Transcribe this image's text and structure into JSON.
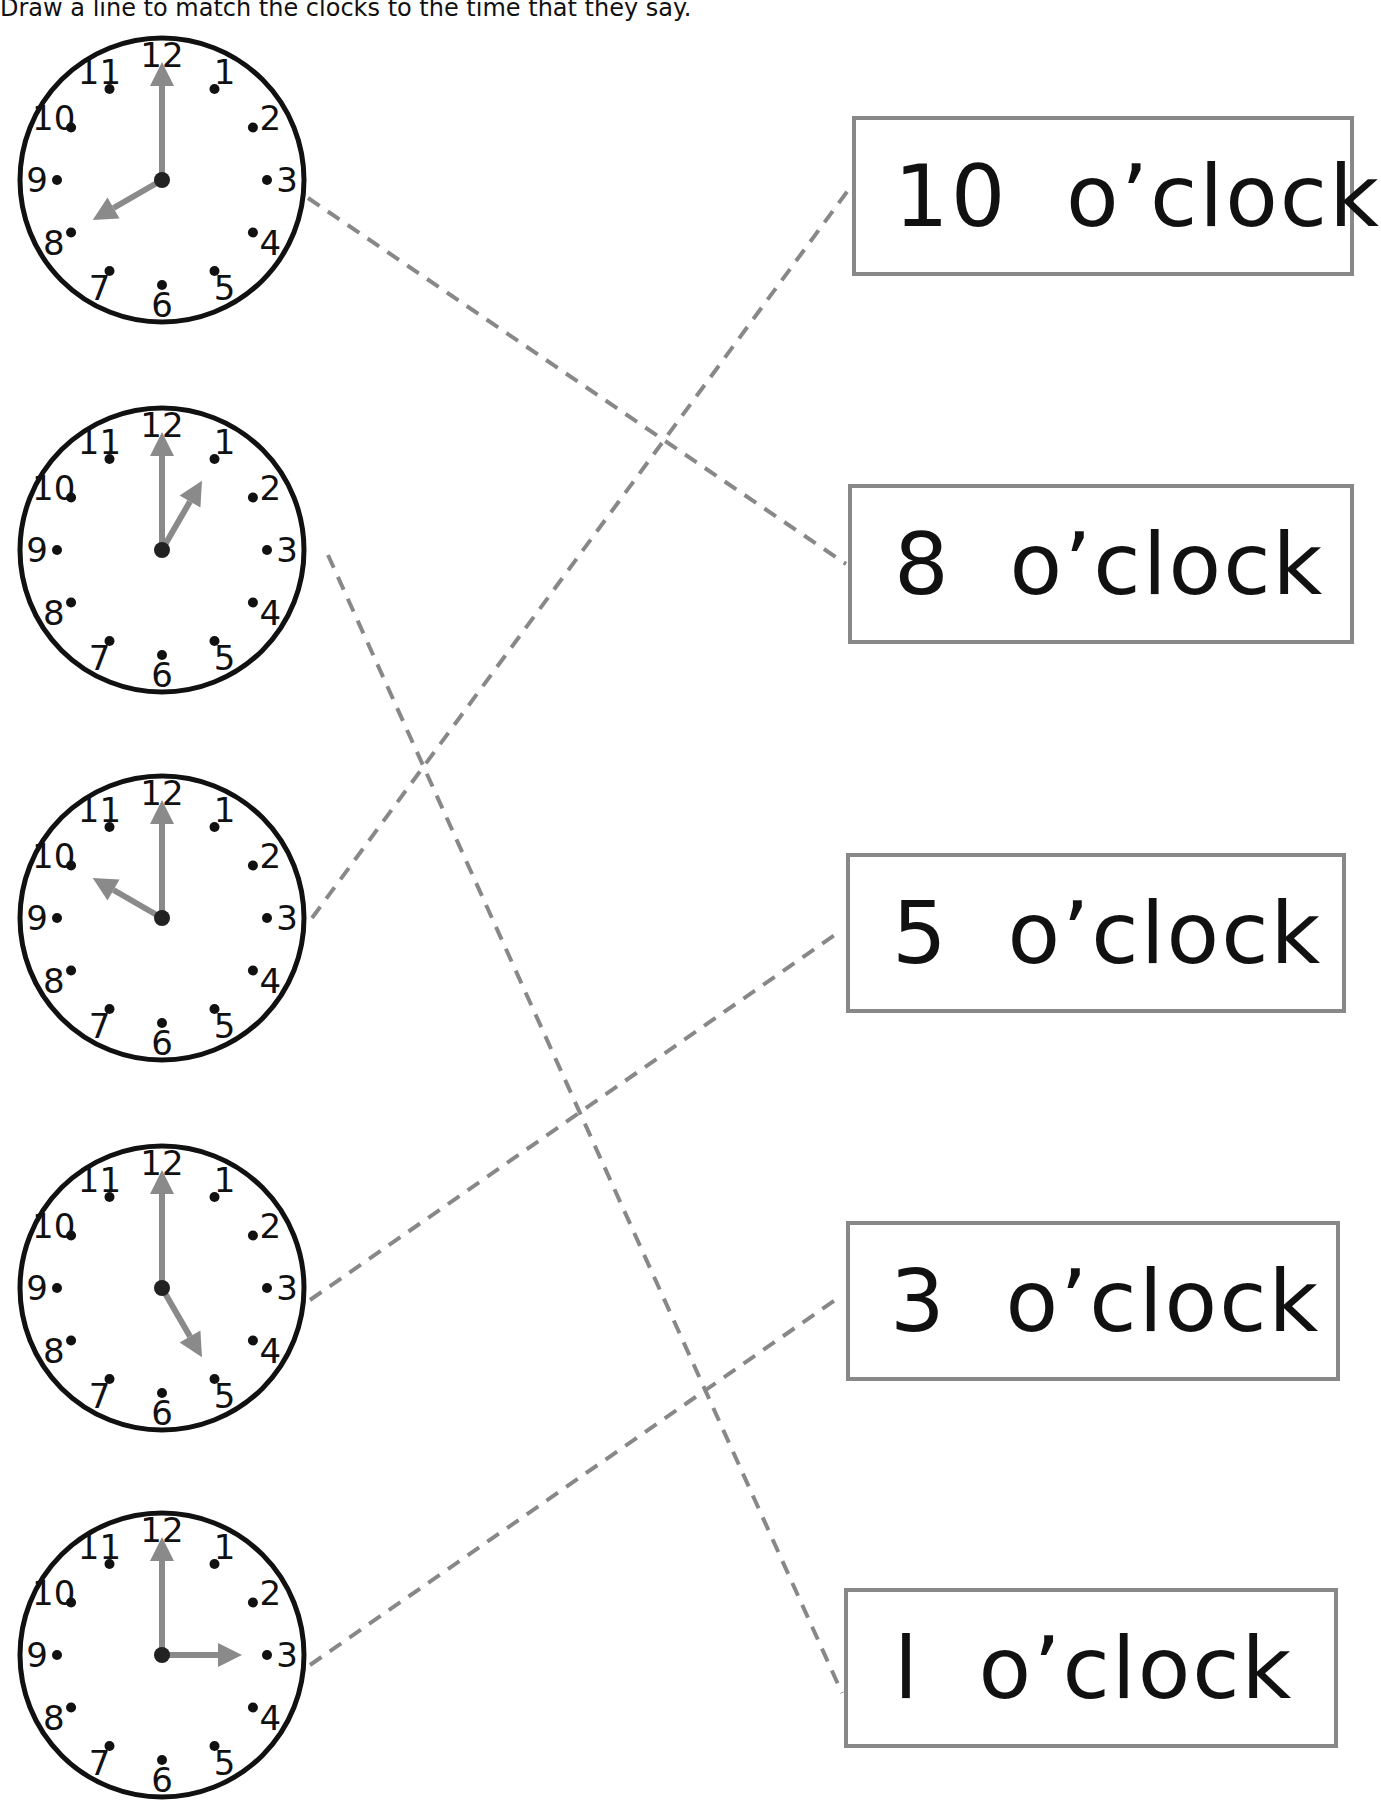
{
  "instructions": "Draw a line to match the clocks to the time that they say.",
  "clocks": [
    {
      "hour": 8,
      "hour_hand_angle": 240,
      "minute_hand_angle": 0
    },
    {
      "hour": 1,
      "hour_hand_angle": 30,
      "minute_hand_angle": 0
    },
    {
      "hour": 10,
      "hour_hand_angle": 300,
      "minute_hand_angle": 0
    },
    {
      "hour": 5,
      "hour_hand_angle": 150,
      "minute_hand_angle": 0
    },
    {
      "hour": 3,
      "hour_hand_angle": 90,
      "minute_hand_angle": 0
    }
  ],
  "labels": [
    "10  o’clock",
    "8  o’clock",
    "5  o’clock",
    "3  o’clock",
    "l  o’clock"
  ],
  "matches": [
    {
      "clock": 0,
      "label": 1
    },
    {
      "clock": 1,
      "label": 4
    },
    {
      "clock": 2,
      "label": 0
    },
    {
      "clock": 3,
      "label": 2
    },
    {
      "clock": 4,
      "label": 3
    }
  ],
  "colors": {
    "line": "#888888",
    "hand": "#8a8a8a",
    "border": "#888888",
    "ink": "#111111"
  }
}
